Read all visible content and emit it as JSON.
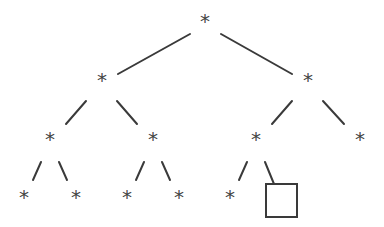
{
  "diagram": {
    "type": "binary-tree",
    "node_symbol": "*",
    "colors": {
      "stroke": "#3a3a3a",
      "label": "#444444",
      "background": "#ffffff"
    },
    "nodes": [
      {
        "id": "n0",
        "label": "*",
        "x": 205,
        "y": 28,
        "level": 0
      },
      {
        "id": "n1",
        "label": "*",
        "x": 102,
        "y": 87,
        "level": 1
      },
      {
        "id": "n2",
        "label": "*",
        "x": 308,
        "y": 87,
        "level": 1
      },
      {
        "id": "n3",
        "label": "*",
        "x": 50,
        "y": 146,
        "level": 2
      },
      {
        "id": "n4",
        "label": "*",
        "x": 153,
        "y": 146,
        "level": 2
      },
      {
        "id": "n5",
        "label": "*",
        "x": 256,
        "y": 146,
        "level": 2
      },
      {
        "id": "n6",
        "label": "*",
        "x": 360,
        "y": 146,
        "level": 2
      },
      {
        "id": "n7",
        "label": "*",
        "x": 24,
        "y": 204,
        "level": 3
      },
      {
        "id": "n8",
        "label": "*",
        "x": 76,
        "y": 204,
        "level": 3
      },
      {
        "id": "n9",
        "label": "*",
        "x": 127,
        "y": 204,
        "level": 3
      },
      {
        "id": "n10",
        "label": "*",
        "x": 179,
        "y": 204,
        "level": 3
      },
      {
        "id": "n11",
        "label": "*",
        "x": 230,
        "y": 204,
        "level": 3
      }
    ],
    "box_node": {
      "id": "n12",
      "x": 266,
      "y": 184,
      "width": 31,
      "height": 33,
      "level": 3
    },
    "edges": [
      {
        "from": "n0",
        "to": "n1",
        "x1": 190,
        "y1": 34,
        "x2": 118,
        "y2": 74
      },
      {
        "from": "n0",
        "to": "n2",
        "x1": 221,
        "y1": 34,
        "x2": 292,
        "y2": 74
      },
      {
        "from": "n1",
        "to": "n3",
        "x1": 86,
        "y1": 101,
        "x2": 66,
        "y2": 124
      },
      {
        "from": "n1",
        "to": "n4",
        "x1": 117,
        "y1": 101,
        "x2": 137,
        "y2": 124
      },
      {
        "from": "n2",
        "to": "n5",
        "x1": 292,
        "y1": 101,
        "x2": 272,
        "y2": 124
      },
      {
        "from": "n2",
        "to": "n6",
        "x1": 323,
        "y1": 101,
        "x2": 344,
        "y2": 124
      },
      {
        "from": "n3",
        "to": "n7",
        "x1": 41,
        "y1": 162,
        "x2": 33,
        "y2": 180
      },
      {
        "from": "n3",
        "to": "n8",
        "x1": 59,
        "y1": 162,
        "x2": 67,
        "y2": 180
      },
      {
        "from": "n4",
        "to": "n9",
        "x1": 144,
        "y1": 162,
        "x2": 136,
        "y2": 180
      },
      {
        "from": "n4",
        "to": "n10",
        "x1": 162,
        "y1": 162,
        "x2": 170,
        "y2": 180
      },
      {
        "from": "n5",
        "to": "n11",
        "x1": 247,
        "y1": 162,
        "x2": 239,
        "y2": 180
      },
      {
        "from": "n5",
        "to": "n12",
        "x1": 265,
        "y1": 162,
        "x2": 274,
        "y2": 184
      }
    ]
  }
}
